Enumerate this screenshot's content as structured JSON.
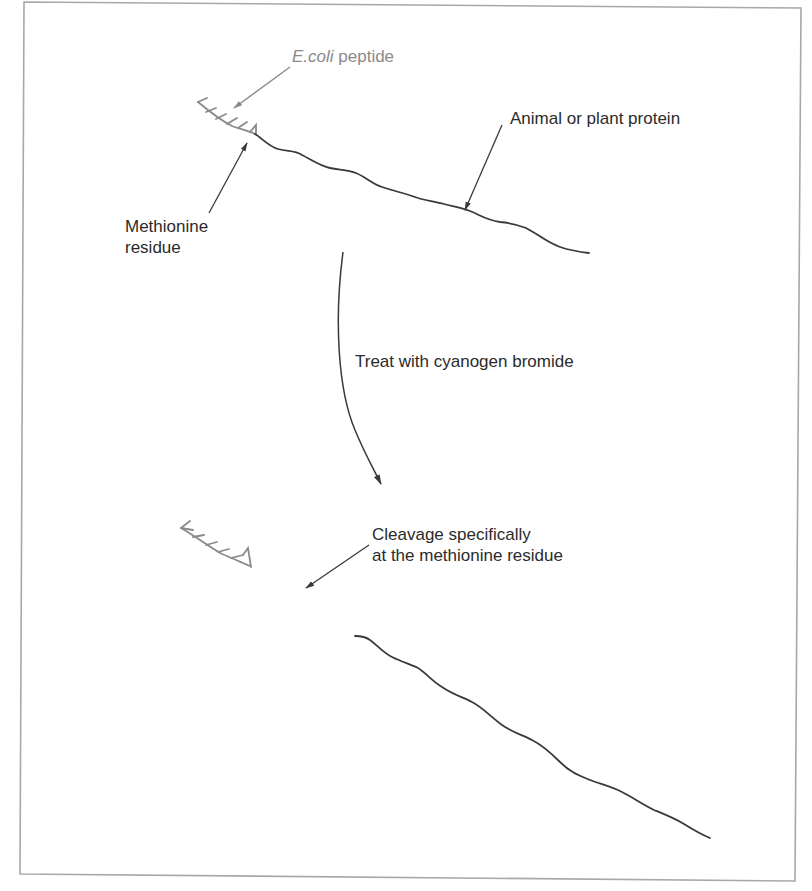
{
  "figure": {
    "colors": {
      "frame": "#a8a8a8",
      "protein": "#3a3a3a",
      "peptide": "#8a8a8a",
      "text": "#2b2b2b",
      "peptide_text": "#8a8a8a"
    }
  },
  "labels": {
    "ecoli_peptide": {
      "italic": "E.coli",
      "rest": " peptide"
    },
    "methionine_residue": {
      "line1": "Methionine",
      "line2": "residue"
    },
    "animal_plant_protein": "Animal or plant protein",
    "treatment": "Treat with cyanogen bromide",
    "cleavage": {
      "line1": "Cleavage specifically",
      "line2": "at the methionine residue"
    }
  }
}
